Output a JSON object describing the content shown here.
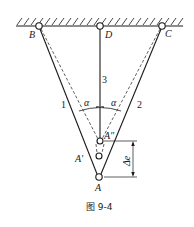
{
  "figure": {
    "caption": "图 9-4",
    "labels": {
      "B": "B",
      "C": "C",
      "D": "D",
      "A": "A",
      "A_prime": "A′",
      "A_double_prime": "A″",
      "bar1": "1",
      "bar2": "2",
      "bar3": "3",
      "alpha_left": "α",
      "alpha_right": "α",
      "delta_e": "Δe"
    },
    "points": {
      "B": [
        39,
        26
      ],
      "D": [
        100,
        26
      ],
      "C": [
        162,
        26
      ],
      "A": [
        99,
        177
      ],
      "A_prime": [
        99,
        156
      ],
      "A_double_prime": [
        100,
        141
      ]
    },
    "colors": {
      "stroke": "#1a1a1a",
      "background": "#ffffff"
    }
  }
}
